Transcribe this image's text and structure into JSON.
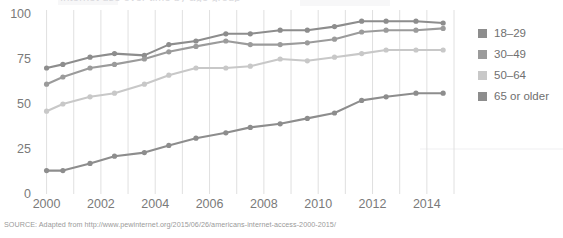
{
  "figure": {
    "title_sliver": "Internet use over time by age group",
    "source_note": "SOURCE: Adapted from http://www.pewinternet.org/2015/06/26/americans-internet-access-2000-2015/"
  },
  "legend": {
    "position": "right",
    "items": [
      {
        "label": "18–29",
        "color": "#8d8d8d",
        "name": "legend-item-18-29"
      },
      {
        "label": "30–49",
        "color": "#9b9b9b",
        "name": "legend-item-30-49"
      },
      {
        "label": "50–64",
        "color": "#c8c8c8",
        "name": "legend-item-50-64"
      },
      {
        "label": "65 or older",
        "color": "#8d8d8d",
        "name": "legend-item-65-or-older"
      }
    ]
  },
  "chart_data": {
    "type": "line",
    "title": "Internet use over time by age group",
    "xlabel": "",
    "ylabel": "",
    "xlim": [
      1999.5,
      2015.0
    ],
    "ylim": [
      0,
      100
    ],
    "grid": true,
    "y_ticks": [
      0,
      25,
      50,
      75,
      100
    ],
    "x_ticks": [
      2000,
      2002,
      2004,
      2006,
      2008,
      2010,
      2012,
      2014
    ],
    "x": [
      2000,
      2000.6,
      2001.6,
      2002.5,
      2003.6,
      2004.5,
      2005.5,
      2006.6,
      2007.5,
      2008.6,
      2009.6,
      2010.6,
      2011.6,
      2012.5,
      2013.6,
      2014.6
    ],
    "series": [
      {
        "name": "18–29",
        "color": "#8d8d8d",
        "values": [
          70,
          72,
          76,
          78,
          77,
          83,
          85,
          89,
          89,
          91,
          91,
          93,
          96,
          96,
          96,
          95
        ]
      },
      {
        "name": "30–49",
        "color": "#9b9b9b",
        "values": [
          61,
          65,
          70,
          72,
          75,
          79,
          82,
          85,
          83,
          83,
          84,
          86,
          90,
          91,
          91,
          92
        ]
      },
      {
        "name": "50–64",
        "color": "#c8c8c8",
        "values": [
          46,
          50,
          54,
          56,
          61,
          66,
          70,
          70,
          71,
          75,
          74,
          76,
          78,
          80,
          80,
          80
        ]
      },
      {
        "name": "65 or older",
        "color": "#8d8d8d",
        "values": [
          13,
          13,
          17,
          21,
          23,
          27,
          31,
          34,
          37,
          39,
          42,
          45,
          52,
          54,
          56,
          56
        ]
      }
    ]
  }
}
